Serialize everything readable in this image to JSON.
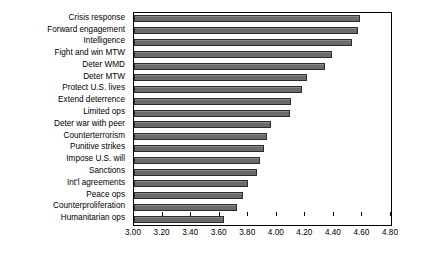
{
  "chart_data": {
    "type": "bar",
    "orientation": "horizontal",
    "title": "",
    "xlabel": "",
    "ylabel": "",
    "xlim": [
      3.0,
      4.8
    ],
    "xtick_step": 0.2,
    "xticks": [
      "3.00",
      "3.20",
      "3.40",
      "3.60",
      "3.80",
      "4.00",
      "4.20",
      "4.40",
      "4.60",
      "4.80"
    ],
    "grid": false,
    "legend": null,
    "bar_color": "#6f6f6f",
    "bar_edge_color": "#2b2b2b",
    "categories": [
      "Crisis response",
      "Forward engagement",
      "Intelligence",
      "Fight and win MTW",
      "Deter WMD",
      "Deter MTW",
      "Protect U.S. lives",
      "Extend deterrence",
      "Limited ops",
      "Deter war with peer",
      "Counterterrorism",
      "Punitive strikes",
      "Impose U.S. will",
      "Sanctions",
      "Int'l agreements",
      "Peace ops",
      "Counterproliferation",
      "Humanitarian ops"
    ],
    "values": [
      4.58,
      4.57,
      4.53,
      4.39,
      4.34,
      4.21,
      4.18,
      4.1,
      4.09,
      3.96,
      3.93,
      3.91,
      3.88,
      3.86,
      3.8,
      3.76,
      3.72,
      3.63
    ]
  }
}
